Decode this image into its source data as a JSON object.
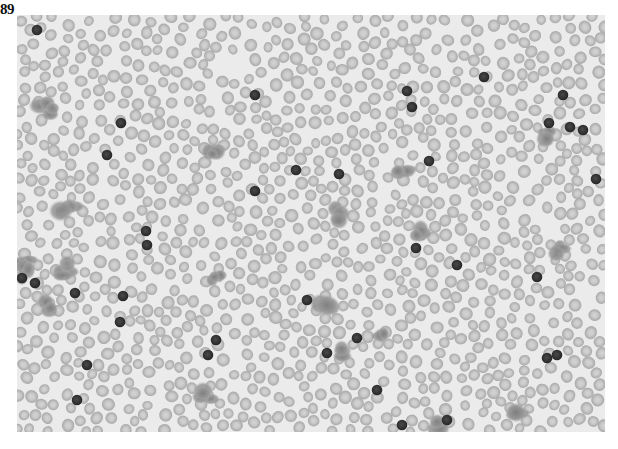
{
  "figure": {
    "label": "89"
  },
  "image": {
    "x": 17,
    "y": 15,
    "width": 588,
    "height": 417,
    "colors": {
      "background": "#ebebeb",
      "rbc_fill": "#b9b9b9",
      "rbc_center": "#d2d2d2",
      "dark_cell": "#353535",
      "platelet_clump": "#8c8c8c"
    },
    "dark_cells": [
      [
        20,
        15
      ],
      [
        104,
        108
      ],
      [
        90,
        140
      ],
      [
        5,
        263
      ],
      [
        18,
        268
      ],
      [
        238,
        80
      ],
      [
        279,
        155
      ],
      [
        129,
        216
      ],
      [
        130,
        230
      ],
      [
        106,
        281
      ],
      [
        103,
        307
      ],
      [
        58,
        278
      ],
      [
        199,
        325
      ],
      [
        191,
        340
      ],
      [
        238,
        176
      ],
      [
        322,
        159
      ],
      [
        390,
        76
      ],
      [
        412,
        146
      ],
      [
        467,
        62
      ],
      [
        395,
        92
      ],
      [
        546,
        80
      ],
      [
        532,
        108
      ],
      [
        553,
        112
      ],
      [
        566,
        115
      ],
      [
        520,
        262
      ],
      [
        579,
        164
      ],
      [
        310,
        338
      ],
      [
        360,
        375
      ],
      [
        540,
        340
      ],
      [
        530,
        343
      ],
      [
        440,
        250
      ],
      [
        399,
        233
      ],
      [
        385,
        410
      ],
      [
        430,
        405
      ],
      [
        70,
        350
      ],
      [
        60,
        385
      ],
      [
        290,
        285
      ],
      [
        340,
        323
      ]
    ],
    "platelet_clumps": [
      [
        30,
        95,
        14
      ],
      [
        195,
        138,
        12
      ],
      [
        50,
        190,
        14
      ],
      [
        8,
        250,
        12
      ],
      [
        48,
        255,
        13
      ],
      [
        30,
        290,
        12
      ],
      [
        200,
        265,
        11
      ],
      [
        318,
        200,
        14
      ],
      [
        385,
        160,
        12
      ],
      [
        405,
        218,
        13
      ],
      [
        530,
        120,
        12
      ],
      [
        545,
        235,
        12
      ],
      [
        308,
        292,
        14
      ],
      [
        365,
        322,
        10
      ],
      [
        328,
        338,
        12
      ],
      [
        190,
        380,
        14
      ],
      [
        500,
        400,
        13
      ],
      [
        420,
        412,
        12
      ]
    ]
  }
}
